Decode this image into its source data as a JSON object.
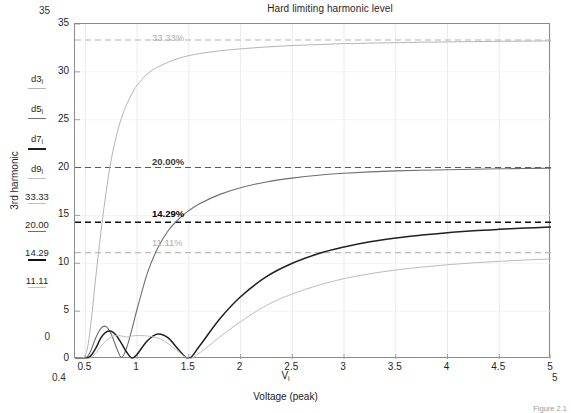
{
  "figure": {
    "title": "Hard limiting harmonic level",
    "caption": "Figure 2.1"
  },
  "axes": {
    "y_label": "3rd harmonic",
    "x_label_symbol": "V",
    "x_label_sub": "i",
    "x_label_name": "Voltage (peak)",
    "y_ticks": [
      "0",
      "5",
      "10",
      "15",
      "20",
      "25",
      "30",
      "35"
    ],
    "x_ticks": [
      "0.5",
      "1",
      "1.5",
      "2",
      "2.5",
      "3",
      "3.5",
      "4",
      "4.5",
      "5"
    ],
    "y_range_top": "35",
    "y_range_bottom": "0",
    "x_range_left": "0.4",
    "x_range_right": "5",
    "grid": "on"
  },
  "legend": {
    "items": [
      {
        "label": "d3",
        "sub": "i",
        "color": "#b4b4b4",
        "width": "1.6"
      },
      {
        "label": "d5",
        "sub": "i",
        "color": "#6e6e6e",
        "width": "1.8"
      },
      {
        "label": "d7",
        "sub": "i",
        "color": "#202020",
        "width": "2.4"
      },
      {
        "label": "d9",
        "sub": "i",
        "color": "#bcbcbc",
        "width": "1.6"
      },
      {
        "label": "33.33",
        "sub": "",
        "color": "#c2c2c2",
        "width": "1.6"
      },
      {
        "label": "20.00",
        "sub": "",
        "color": "#6e6e6e",
        "width": "1.8"
      },
      {
        "label": "14.29",
        "sub": "",
        "color": "#111111",
        "width": "2.6"
      },
      {
        "label": "11.11",
        "sub": "",
        "color": "#c2c2c2",
        "width": "1.6"
      }
    ]
  },
  "callouts": [
    {
      "text": "33.33%",
      "tone": "light",
      "x": 78,
      "y": 32
    },
    {
      "text": "20.00%",
      "tone": "mid",
      "x": 78,
      "y": 156
    },
    {
      "text": "14.29%",
      "tone": "dark",
      "x": 78,
      "y": 208
    },
    {
      "text": "11.11%",
      "tone": "light",
      "x": 78,
      "y": 237
    }
  ],
  "chart_data": {
    "type": "line",
    "title": "Hard limiting harmonic level",
    "xlabel": "Voltage (peak)",
    "ylabel": "3rd harmonic",
    "xlim": [
      0.4,
      5
    ],
    "ylim": [
      0,
      35
    ],
    "xticks": [
      0.5,
      1,
      1.5,
      2,
      2.5,
      3,
      3.5,
      4,
      4.5,
      5
    ],
    "yticks": [
      0,
      5,
      10,
      15,
      20,
      25,
      30,
      35
    ],
    "grid": true,
    "legend_position": "left-outside",
    "reference_lines": [
      {
        "name": "33.33%",
        "value": 33.33,
        "style": "dashed",
        "color": "#b4b4b4"
      },
      {
        "name": "20.00%",
        "value": 20.0,
        "style": "dashed",
        "color": "#5a5a5a"
      },
      {
        "name": "14.29%",
        "value": 14.29,
        "style": "dashed",
        "color": "#111111"
      },
      {
        "name": "11.11%",
        "value": 11.11,
        "style": "dashed",
        "color": "#bcbcbc"
      }
    ],
    "x": [
      0.4,
      0.5,
      0.55,
      0.6,
      0.65,
      0.7,
      0.75,
      0.8,
      0.85,
      0.9,
      0.95,
      1.0,
      1.1,
      1.2,
      1.3,
      1.4,
      1.5,
      1.6,
      1.8,
      2.0,
      2.25,
      2.5,
      2.75,
      3.0,
      3.25,
      3.5,
      3.75,
      4.0,
      4.25,
      4.5,
      4.75,
      5.0
    ],
    "series": [
      {
        "name": "d3i",
        "color": "#b4b4b4",
        "asymptote": 33.33,
        "values": [
          0,
          0.4,
          3.4,
          8.5,
          13.2,
          17.4,
          20.8,
          23.3,
          25.2,
          26.6,
          27.7,
          28.6,
          29.8,
          30.5,
          31.0,
          31.4,
          31.7,
          31.9,
          32.2,
          32.4,
          32.6,
          32.75,
          32.85,
          32.95,
          33.0,
          33.05,
          33.1,
          33.13,
          33.16,
          33.19,
          33.21,
          33.23
        ]
      },
      {
        "name": "d5i",
        "color": "#6e6e6e",
        "asymptote": 20.0,
        "values": [
          0,
          0.05,
          0.8,
          2.2,
          3.2,
          3.4,
          2.6,
          1.2,
          0.15,
          1.2,
          3.1,
          5.2,
          9.0,
          11.6,
          13.4,
          14.6,
          15.5,
          16.2,
          17.2,
          17.9,
          18.5,
          18.9,
          19.2,
          19.4,
          19.55,
          19.65,
          19.72,
          19.78,
          19.83,
          19.87,
          19.9,
          19.93
        ]
      },
      {
        "name": "d7i",
        "color": "#202020",
        "asymptote": 14.29,
        "values": [
          0,
          0.02,
          0.3,
          1.1,
          2.2,
          2.8,
          2.9,
          2.45,
          1.6,
          0.7,
          0.1,
          0.5,
          1.9,
          2.6,
          2.2,
          1.0,
          0.05,
          1.3,
          4.2,
          6.5,
          8.6,
          10.0,
          11.0,
          11.7,
          12.25,
          12.65,
          12.95,
          13.2,
          13.4,
          13.55,
          13.68,
          13.8
        ]
      },
      {
        "name": "d9i",
        "color": "#bcbcbc",
        "asymptote": 11.11,
        "values": [
          0,
          0.01,
          0.15,
          0.6,
          1.3,
          1.9,
          2.3,
          2.45,
          2.4,
          2.3,
          2.4,
          2.45,
          2.4,
          2.2,
          1.6,
          0.75,
          0.05,
          0.6,
          2.3,
          3.9,
          5.6,
          6.8,
          7.7,
          8.4,
          8.9,
          9.3,
          9.6,
          9.85,
          10.05,
          10.2,
          10.35,
          10.45
        ]
      }
    ]
  }
}
